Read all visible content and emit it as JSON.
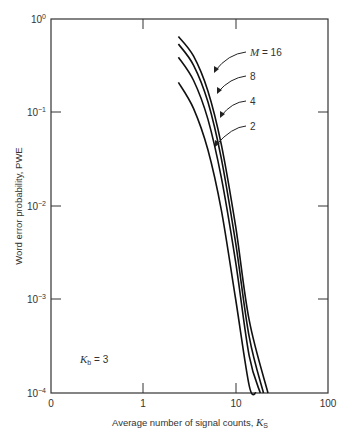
{
  "chart_data": {
    "type": "line",
    "title": "",
    "xlabel": "Average number of signal counts, K_S",
    "xlabel_main": "Average number of signal counts, ",
    "xlabel_symbol": "K",
    "xlabel_sub": "S",
    "ylabel": "Word error probability, PWE",
    "xscale": "log",
    "yscale": "log",
    "xlim": [
      0.1,
      100
    ],
    "ylim": [
      0.0001,
      1
    ],
    "x_tick_labels": [
      "0",
      "1",
      "10",
      "100"
    ],
    "y_tick_labels": [
      {
        "base": "10",
        "exp": "0"
      },
      {
        "base": "10",
        "exp": "−1"
      },
      {
        "base": "10",
        "exp": "−2"
      },
      {
        "base": "10",
        "exp": "−3"
      },
      {
        "base": "10",
        "exp": "−4"
      }
    ],
    "grid": false,
    "annotation": {
      "symbol": "K",
      "sub": "b",
      "text": " = 3"
    },
    "series_label_prefix": "M",
    "series": [
      {
        "name": "M = 16",
        "label": " = 16",
        "points": [
          [
            2.4,
            0.65
          ],
          [
            3.5,
            0.4
          ],
          [
            5,
            0.17
          ],
          [
            7,
            0.045
          ],
          [
            10,
            0.006
          ],
          [
            14,
            0.0006
          ],
          [
            18,
            0.0001
          ],
          [
            22.4,
            0.0001
          ]
        ]
      },
      {
        "name": "M = 8",
        "label": "8",
        "points": [
          [
            2.4,
            0.54
          ],
          [
            3.5,
            0.32
          ],
          [
            5,
            0.13
          ],
          [
            7,
            0.032
          ],
          [
            10,
            0.004
          ],
          [
            14,
            0.0004
          ],
          [
            20,
            0.0001
          ]
        ]
      },
      {
        "name": "M = 4",
        "label": "4",
        "points": [
          [
            2.4,
            0.39
          ],
          [
            3.5,
            0.22
          ],
          [
            5,
            0.085
          ],
          [
            7,
            0.02
          ],
          [
            10,
            0.0025
          ],
          [
            14,
            0.00025
          ],
          [
            18.5,
            0.0001
          ]
        ]
      },
      {
        "name": "M = 2",
        "label": "2",
        "points": [
          [
            2.4,
            0.21
          ],
          [
            3.5,
            0.11
          ],
          [
            5,
            0.04
          ],
          [
            7,
            0.009
          ],
          [
            10,
            0.001
          ],
          [
            14,
            0.00012
          ],
          [
            16.6,
            0.0001
          ]
        ]
      }
    ]
  }
}
